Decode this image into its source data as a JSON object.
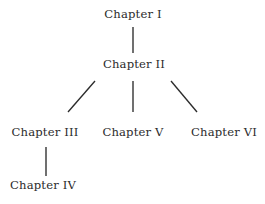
{
  "diagram": {
    "type": "tree",
    "background_color": "#ffffff",
    "text_color": "#2b2b2b",
    "edge_color": "#2b2b2b",
    "canvas": {
      "width": 265,
      "height": 204
    },
    "nodes": [
      {
        "id": "ch1",
        "label": "Chapter I",
        "x": 133,
        "y": 15,
        "level": 0
      },
      {
        "id": "ch2",
        "label": "Chapter II",
        "x": 134,
        "y": 65,
        "level": 1
      },
      {
        "id": "ch3",
        "label": "Chapter III",
        "x": 45,
        "y": 133,
        "level": 2
      },
      {
        "id": "ch5",
        "label": "Chapter V",
        "x": 133,
        "y": 133,
        "level": 2
      },
      {
        "id": "ch6",
        "label": "Chapter VI",
        "x": 224,
        "y": 133,
        "level": 2
      },
      {
        "id": "ch4",
        "label": "Chapter IV",
        "x": 43,
        "y": 186,
        "level": 3
      }
    ],
    "edges": [
      {
        "id": "edge-ch1-ch2",
        "from": "ch1",
        "to": "ch2",
        "x1": 133,
        "y1": 27,
        "x2": 133,
        "y2": 53,
        "kind": "vertical"
      },
      {
        "id": "edge-ch2-ch3",
        "from": "ch2",
        "to": "ch3",
        "x1": 95,
        "y1": 81,
        "x2": 68,
        "y2": 112,
        "kind": "diagonal-left"
      },
      {
        "id": "edge-ch2-ch5",
        "from": "ch2",
        "to": "ch5",
        "x1": 133,
        "y1": 81,
        "x2": 133,
        "y2": 112,
        "kind": "vertical"
      },
      {
        "id": "edge-ch2-ch6",
        "from": "ch2",
        "to": "ch6",
        "x1": 171,
        "y1": 81,
        "x2": 197,
        "y2": 112,
        "kind": "diagonal-right"
      },
      {
        "id": "edge-ch3-ch4",
        "from": "ch3",
        "to": "ch4",
        "x1": 46,
        "y1": 147,
        "x2": 46,
        "y2": 176,
        "kind": "vertical"
      }
    ]
  }
}
